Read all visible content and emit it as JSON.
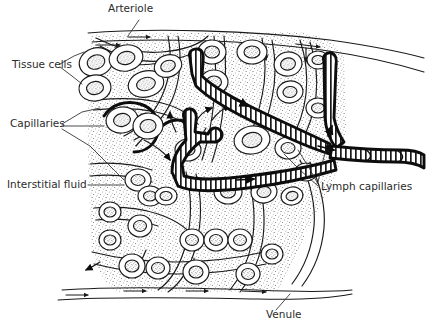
{
  "figure": {
    "background_color": "#ffffff",
    "ink_color": "#1a1a1a",
    "label_color": "#2b2b2b",
    "stipple_color": "#6d6d6d"
  },
  "labels": {
    "arteriole": "Arteriole",
    "tissue_cells": "Tissue cells",
    "capillaries": "Capillaries",
    "interstitial_fluid": "Interstitial fluid",
    "lymph_capillaries": "Lymph capillaries",
    "venule": "Venule"
  },
  "structures": [
    {
      "name": "arteriole",
      "label": "Arteriole",
      "kind": "blood-vessel",
      "position": "top",
      "flow_direction": "left-to-right",
      "line_weight": "thin",
      "arrow_count": 2
    },
    {
      "name": "venule",
      "label": "Venule",
      "kind": "blood-vessel",
      "position": "bottom",
      "flow_direction": "left-to-right",
      "line_weight": "thin",
      "arrow_count": 4
    },
    {
      "name": "capillaries",
      "label": "Capillaries",
      "kind": "blood-vessel",
      "position": "throughout-tissue",
      "line_weight": "medium",
      "description": "thin looping vessels weaving between tissue cells"
    },
    {
      "name": "lymph-capillaries",
      "label": "Lymph capillaries",
      "kind": "lymphatic-vessel",
      "position": "center-right",
      "line_weight": "thick",
      "fill_pattern": "vertical-hatching",
      "blind_ended": true,
      "drain_direction": "right",
      "description": "blind-ended hatched tubes converging into a collecting lymph vessel"
    },
    {
      "name": "tissue-cells",
      "label": "Tissue cells",
      "kind": "cell",
      "description": "rounded outlined cells with stippled nuclei"
    },
    {
      "name": "interstitial-fluid",
      "label": "Interstitial fluid",
      "kind": "fluid-space",
      "texture": "stipple",
      "description": "stippled space surrounding tissue cells"
    }
  ],
  "label_placements": {
    "arteriole": {
      "x": 108,
      "y": 12,
      "anchor": "start"
    },
    "tissue_cells": {
      "x": 12,
      "y": 68,
      "anchor": "start"
    },
    "capillaries": {
      "x": 10,
      "y": 127,
      "anchor": "start"
    },
    "interstitial_fluid": {
      "x": 7,
      "y": 188,
      "anchor": "start"
    },
    "lymph_capillaries": {
      "x": 321,
      "y": 190,
      "anchor": "start"
    },
    "venule": {
      "x": 266,
      "y": 318,
      "anchor": "start"
    }
  }
}
